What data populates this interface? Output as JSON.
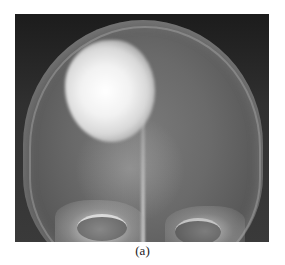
{
  "figure": {
    "type": "skull-x-ray-radiograph",
    "caption": "(a)"
  }
}
